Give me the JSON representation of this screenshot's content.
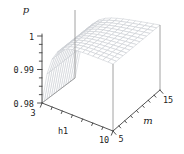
{
  "figure": {
    "title": "",
    "background": "#ffffff",
    "colors": {
      "mesh_line": "#c6cad0",
      "surface_fill": "#ffffff",
      "box_edge": "#8a8a8a",
      "axis": "#3f3f3f",
      "text": "#1c1c1c"
    },
    "axes": {
      "z": {
        "label": "p",
        "range": [
          0.98,
          1
        ],
        "major_tick_labels": [
          "0.98",
          "0.99",
          "1"
        ],
        "major_tick_values": [
          0.98,
          0.99,
          1
        ],
        "minor_ticks_between_majors": 3
      },
      "x": {
        "label": "h1",
        "range": [
          3,
          10
        ],
        "tick_labels": [
          "3",
          "10"
        ],
        "tick_values": [
          3,
          10
        ],
        "minor_tick_values": [
          4,
          5,
          6,
          7,
          8,
          9
        ]
      },
      "y": {
        "label": "m",
        "range": [
          5,
          15
        ],
        "tick_labels": [
          "5",
          "15"
        ],
        "tick_values": [
          5,
          15
        ],
        "minor_tick_values": [
          6.25,
          7.5,
          8.75,
          10,
          11.25,
          12.5,
          13.75
        ]
      }
    }
  },
  "chart_data": {
    "type": "surface",
    "title": "",
    "xlabel": "h1",
    "ylabel": "m",
    "zlabel": "p",
    "x_range": [
      3,
      10
    ],
    "y_range": [
      5,
      15
    ],
    "z_range": [
      0.98,
      1
    ],
    "grid": true,
    "surface_style": "white-filled wireframe mesh, plateau near p=1",
    "z_formula": "p ≈ 1 - 0.02*exp(-1.25*(h1-3)), approximately independent of m",
    "x": [
      3,
      3.5,
      4,
      4.5,
      5,
      5.5,
      6,
      6.5,
      7,
      7.5,
      8,
      8.5,
      9,
      9.5,
      10
    ],
    "y": [
      5,
      5.71,
      6.43,
      7.14,
      7.86,
      8.57,
      9.29,
      10,
      10.71,
      11.43,
      12.14,
      12.86,
      13.57,
      14.29,
      15
    ],
    "z_by_x": [
      0.98,
      0.98929,
      0.99427,
      0.99693,
      0.99836,
      0.99912,
      0.99953,
      0.99975,
      0.99987,
      0.99993,
      0.99996,
      0.99998,
      0.99999,
      0.99999,
      0.99999
    ]
  }
}
